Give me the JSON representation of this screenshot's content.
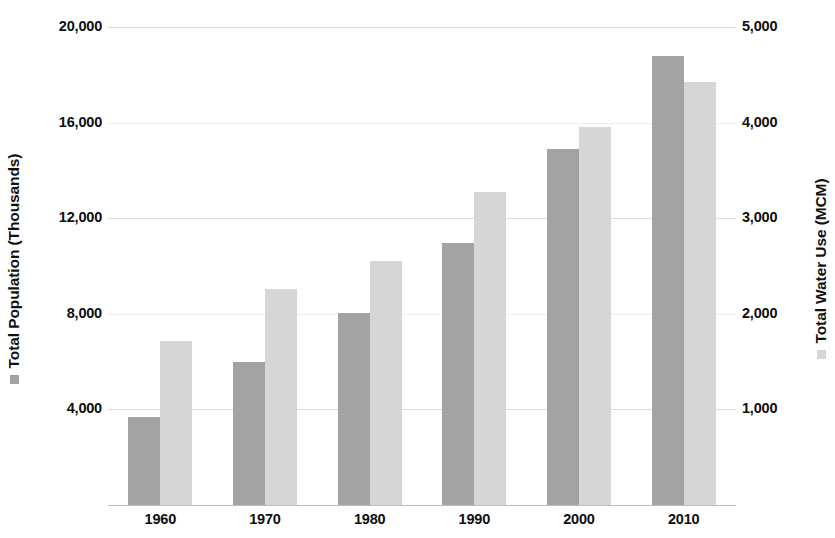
{
  "chart_data": {
    "type": "bar",
    "title": "",
    "subtitle": "",
    "xlabel": "",
    "categories": [
      "1960",
      "1970",
      "1980",
      "1990",
      "2000",
      "2010"
    ],
    "series": [
      {
        "name": "Total Population (Thousands)",
        "axis": "left",
        "color": "#a3a3a3",
        "values": [
          3700,
          6000,
          8050,
          10950,
          14900,
          18800
        ]
      },
      {
        "name": "Total Water Use (MCM)",
        "axis": "right",
        "color": "#d6d6d6",
        "values": [
          1720,
          2260,
          2550,
          3270,
          3950,
          4430
        ]
      }
    ],
    "left_axis": {
      "label": "Total Population (Thousands)",
      "ticks": [
        "4,000",
        "8,000",
        "12,000",
        "16,000",
        "20,000"
      ],
      "tick_values": [
        4000,
        8000,
        12000,
        16000,
        20000
      ],
      "ylim": [
        0,
        20800
      ]
    },
    "right_axis": {
      "label": "Total Water Use (MCM)",
      "ticks": [
        "1,000",
        "2,000",
        "3,000",
        "4,000",
        "5,000"
      ],
      "tick_values": [
        1000,
        2000,
        3000,
        4000,
        5000
      ],
      "ylim": [
        0,
        5200
      ]
    },
    "grid": true,
    "legend_position": "axis-titles",
    "background": "#ffffff"
  }
}
